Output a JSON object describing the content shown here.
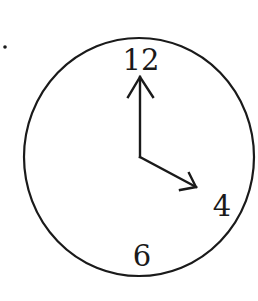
{
  "figure": {
    "type": "analog-clock",
    "marker": ".",
    "numerals": {
      "top": "12",
      "right_lower": "4",
      "bottom": "6"
    },
    "hands": {
      "minute_points_to": "12",
      "hour_points_to": "4"
    },
    "time_shown": "4:00",
    "colors": {
      "stroke": "#1a1a1a",
      "background": "#ffffff"
    }
  }
}
